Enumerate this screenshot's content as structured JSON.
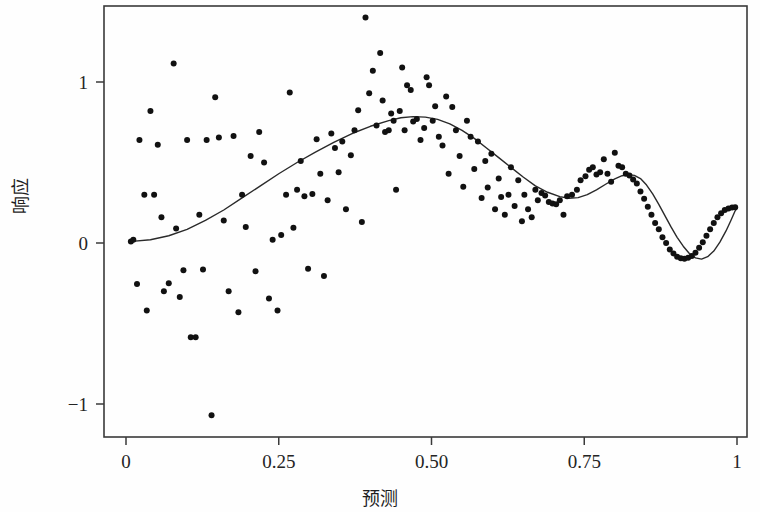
{
  "chart_data": {
    "type": "scatter",
    "title": "",
    "subtitle": "",
    "xlabel": "预测",
    "ylabel": "响应",
    "xlim": [
      -0.015,
      1.05
    ],
    "ylim": [
      -1.2,
      1.49
    ],
    "grid": false,
    "legend": null,
    "xticks": [
      0,
      0.25,
      0.5,
      0.75,
      1
    ],
    "xtick_labels": [
      "0",
      "0.25",
      "0.50",
      "0.75",
      "1"
    ],
    "yticks": [
      -1,
      0,
      1
    ],
    "ytick_labels": [
      "−1",
      "0",
      "1"
    ],
    "point_color": "#111111",
    "line_color": "#2a2a2a",
    "axis_color": "#3a3a3a",
    "background_color": "#fefefe",
    "point_size": 3.0,
    "line_width": 1.4,
    "series": [
      {
        "name": "观测点",
        "type": "scatter",
        "points": [
          [
            0.008,
            0.01
          ],
          [
            0.012,
            0.02
          ],
          [
            0.018,
            -0.255
          ],
          [
            0.022,
            0.64
          ],
          [
            0.03,
            0.3
          ],
          [
            0.034,
            -0.42
          ],
          [
            0.04,
            0.82
          ],
          [
            0.046,
            0.3
          ],
          [
            0.052,
            0.61
          ],
          [
            0.058,
            0.16
          ],
          [
            0.062,
            -0.3
          ],
          [
            0.07,
            -0.25
          ],
          [
            0.078,
            1.115
          ],
          [
            0.082,
            0.09
          ],
          [
            0.088,
            -0.335
          ],
          [
            0.094,
            -0.17
          ],
          [
            0.1,
            0.64
          ],
          [
            0.106,
            -0.585
          ],
          [
            0.114,
            -0.585
          ],
          [
            0.12,
            0.175
          ],
          [
            0.126,
            -0.165
          ],
          [
            0.132,
            0.64
          ],
          [
            0.14,
            -1.07
          ],
          [
            0.146,
            0.905
          ],
          [
            0.152,
            0.655
          ],
          [
            0.16,
            0.14
          ],
          [
            0.168,
            -0.3
          ],
          [
            0.176,
            0.665
          ],
          [
            0.184,
            -0.43
          ],
          [
            0.19,
            0.3
          ],
          [
            0.196,
            0.1
          ],
          [
            0.204,
            0.54
          ],
          [
            0.212,
            -0.175
          ],
          [
            0.218,
            0.69
          ],
          [
            0.226,
            0.5
          ],
          [
            0.234,
            -0.345
          ],
          [
            0.24,
            0.02
          ],
          [
            0.248,
            -0.42
          ],
          [
            0.254,
            0.05
          ],
          [
            0.262,
            0.3
          ],
          [
            0.268,
            0.935
          ],
          [
            0.274,
            0.095
          ],
          [
            0.28,
            0.33
          ],
          [
            0.286,
            0.51
          ],
          [
            0.292,
            0.29
          ],
          [
            0.298,
            -0.16
          ],
          [
            0.305,
            0.305
          ],
          [
            0.312,
            0.645
          ],
          [
            0.318,
            0.43
          ],
          [
            0.324,
            -0.205
          ],
          [
            0.33,
            0.265
          ],
          [
            0.336,
            0.68
          ],
          [
            0.342,
            0.59
          ],
          [
            0.348,
            0.44
          ],
          [
            0.354,
            0.63
          ],
          [
            0.36,
            0.21
          ],
          [
            0.368,
            0.545
          ],
          [
            0.374,
            0.7
          ],
          [
            0.38,
            0.825
          ],
          [
            0.386,
            0.13
          ],
          [
            0.392,
            1.4
          ],
          [
            0.398,
            0.93
          ],
          [
            0.404,
            1.07
          ],
          [
            0.41,
            0.73
          ],
          [
            0.416,
            1.18
          ],
          [
            0.42,
            0.885
          ],
          [
            0.424,
            0.69
          ],
          [
            0.43,
            0.7
          ],
          [
            0.434,
            0.805
          ],
          [
            0.438,
            0.76
          ],
          [
            0.442,
            0.33
          ],
          [
            0.448,
            0.82
          ],
          [
            0.452,
            1.09
          ],
          [
            0.456,
            0.7
          ],
          [
            0.46,
            0.98
          ],
          [
            0.466,
            0.95
          ],
          [
            0.47,
            0.755
          ],
          [
            0.476,
            0.77
          ],
          [
            0.482,
            0.64
          ],
          [
            0.488,
            0.715
          ],
          [
            0.492,
            1.03
          ],
          [
            0.496,
            0.98
          ],
          [
            0.502,
            0.76
          ],
          [
            0.506,
            0.85
          ],
          [
            0.512,
            0.66
          ],
          [
            0.518,
            0.605
          ],
          [
            0.524,
            0.91
          ],
          [
            0.528,
            0.43
          ],
          [
            0.534,
            0.845
          ],
          [
            0.54,
            0.7
          ],
          [
            0.546,
            0.54
          ],
          [
            0.552,
            0.35
          ],
          [
            0.558,
            0.76
          ],
          [
            0.564,
            0.66
          ],
          [
            0.57,
            0.46
          ],
          [
            0.576,
            0.63
          ],
          [
            0.582,
            0.28
          ],
          [
            0.588,
            0.51
          ],
          [
            0.592,
            0.345
          ],
          [
            0.598,
            0.555
          ],
          [
            0.604,
            0.21
          ],
          [
            0.61,
            0.4
          ],
          [
            0.614,
            0.285
          ],
          [
            0.62,
            0.175
          ],
          [
            0.626,
            0.3
          ],
          [
            0.63,
            0.47
          ],
          [
            0.636,
            0.23
          ],
          [
            0.642,
            0.39
          ],
          [
            0.648,
            0.135
          ],
          [
            0.652,
            0.3
          ],
          [
            0.658,
            0.21
          ],
          [
            0.664,
            0.16
          ],
          [
            0.67,
            0.33
          ],
          [
            0.674,
            0.265
          ],
          [
            0.68,
            0.31
          ],
          [
            0.686,
            0.295
          ],
          [
            0.692,
            0.255
          ],
          [
            0.698,
            0.245
          ],
          [
            0.704,
            0.24
          ],
          [
            0.71,
            0.265
          ],
          [
            0.716,
            0.175
          ],
          [
            0.722,
            0.29
          ],
          [
            0.73,
            0.3
          ],
          [
            0.738,
            0.33
          ],
          [
            0.744,
            0.39
          ],
          [
            0.752,
            0.415
          ],
          [
            0.758,
            0.455
          ],
          [
            0.764,
            0.47
          ],
          [
            0.77,
            0.425
          ],
          [
            0.776,
            0.44
          ],
          [
            0.782,
            0.52
          ],
          [
            0.788,
            0.43
          ],
          [
            0.794,
            0.38
          ],
          [
            0.8,
            0.56
          ],
          [
            0.806,
            0.48
          ],
          [
            0.812,
            0.47
          ],
          [
            0.818,
            0.43
          ],
          [
            0.824,
            0.42
          ],
          [
            0.83,
            0.395
          ],
          [
            0.836,
            0.37
          ],
          [
            0.842,
            0.32
          ],
          [
            0.848,
            0.275
          ],
          [
            0.854,
            0.225
          ],
          [
            0.86,
            0.175
          ],
          [
            0.866,
            0.125
          ],
          [
            0.872,
            0.085
          ],
          [
            0.878,
            0.035
          ],
          [
            0.884,
            0.0
          ],
          [
            0.89,
            -0.04
          ],
          [
            0.896,
            -0.065
          ],
          [
            0.902,
            -0.085
          ],
          [
            0.908,
            -0.095
          ],
          [
            0.914,
            -0.098
          ],
          [
            0.92,
            -0.092
          ],
          [
            0.926,
            -0.08
          ],
          [
            0.932,
            -0.06
          ],
          [
            0.938,
            -0.03
          ],
          [
            0.944,
            0.005
          ],
          [
            0.95,
            0.045
          ],
          [
            0.956,
            0.085
          ],
          [
            0.962,
            0.125
          ],
          [
            0.968,
            0.16
          ],
          [
            0.974,
            0.185
          ],
          [
            0.98,
            0.205
          ],
          [
            0.986,
            0.215
          ],
          [
            0.992,
            0.22
          ],
          [
            0.997,
            0.222
          ]
        ]
      },
      {
        "name": "拟合曲线",
        "type": "line",
        "points": [
          [
            0.01,
            0.01
          ],
          [
            0.04,
            0.02
          ],
          [
            0.07,
            0.045
          ],
          [
            0.1,
            0.085
          ],
          [
            0.13,
            0.14
          ],
          [
            0.16,
            0.205
          ],
          [
            0.19,
            0.28
          ],
          [
            0.22,
            0.355
          ],
          [
            0.25,
            0.43
          ],
          [
            0.28,
            0.5
          ],
          [
            0.31,
            0.565
          ],
          [
            0.34,
            0.625
          ],
          [
            0.37,
            0.68
          ],
          [
            0.4,
            0.725
          ],
          [
            0.43,
            0.76
          ],
          [
            0.45,
            0.778
          ],
          [
            0.47,
            0.785
          ],
          [
            0.49,
            0.782
          ],
          [
            0.51,
            0.768
          ],
          [
            0.53,
            0.74
          ],
          [
            0.55,
            0.7
          ],
          [
            0.57,
            0.65
          ],
          [
            0.59,
            0.59
          ],
          [
            0.61,
            0.53
          ],
          [
            0.63,
            0.47
          ],
          [
            0.65,
            0.41
          ],
          [
            0.67,
            0.355
          ],
          [
            0.69,
            0.315
          ],
          [
            0.71,
            0.288
          ],
          [
            0.725,
            0.278
          ],
          [
            0.74,
            0.282
          ],
          [
            0.755,
            0.3
          ],
          [
            0.77,
            0.33
          ],
          [
            0.785,
            0.365
          ],
          [
            0.8,
            0.398
          ],
          [
            0.812,
            0.418
          ],
          [
            0.822,
            0.425
          ],
          [
            0.832,
            0.42
          ],
          [
            0.842,
            0.4
          ],
          [
            0.852,
            0.36
          ],
          [
            0.862,
            0.305
          ],
          [
            0.872,
            0.24
          ],
          [
            0.882,
            0.17
          ],
          [
            0.892,
            0.1
          ],
          [
            0.902,
            0.035
          ],
          [
            0.912,
            -0.02
          ],
          [
            0.922,
            -0.065
          ],
          [
            0.932,
            -0.092
          ],
          [
            0.942,
            -0.1
          ],
          [
            0.952,
            -0.085
          ],
          [
            0.962,
            -0.05
          ],
          [
            0.972,
            0.005
          ],
          [
            0.982,
            0.075
          ],
          [
            0.99,
            0.14
          ],
          [
            0.997,
            0.2
          ],
          [
            1.0,
            0.215
          ]
        ]
      }
    ]
  },
  "axes": {
    "x_title": "预测",
    "y_title": "响应",
    "x_tick_labels": [
      "0",
      "0.25",
      "0.50",
      "0.75",
      "1"
    ],
    "y_tick_labels": [
      "1",
      "0",
      "−1"
    ]
  }
}
